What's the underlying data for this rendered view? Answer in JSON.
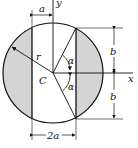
{
  "diagram": {
    "labels": {
      "y_axis": "y",
      "x_axis": "x",
      "center": "C",
      "radius": "r",
      "half_width": "a",
      "chord_spacing": "2a",
      "half_height_top": "b",
      "half_height_bottom": "b",
      "angle_top": "α",
      "angle_bottom": "α"
    },
    "colors": {
      "shade": "#d4d4d4",
      "stroke": "#111111",
      "background": "#ffffff"
    }
  }
}
